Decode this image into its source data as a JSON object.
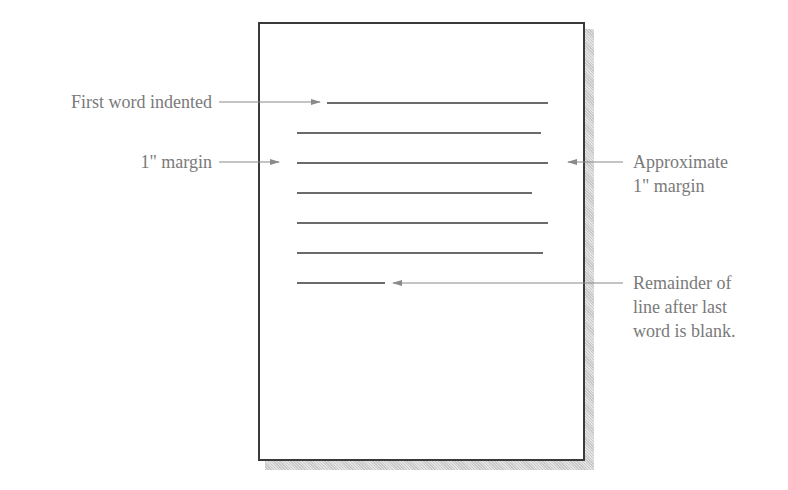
{
  "diagram": {
    "labels": {
      "first_word_indented": "First word indented",
      "left_margin": "1\" margin",
      "right_margin_line1": "Approximate",
      "right_margin_line2": "1\" margin",
      "remainder_line1": "Remainder of",
      "remainder_line2": "line after last",
      "remainder_line3": "word is blank."
    },
    "text_lines": [
      {
        "x1": 327,
        "x2": 548,
        "y": 103
      },
      {
        "x1": 297,
        "x2": 541,
        "y": 133
      },
      {
        "x1": 297,
        "x2": 548,
        "y": 163
      },
      {
        "x1": 297,
        "x2": 532,
        "y": 193
      },
      {
        "x1": 297,
        "x2": 548,
        "y": 223
      },
      {
        "x1": 297,
        "x2": 543,
        "y": 253
      },
      {
        "x1": 297,
        "x2": 385,
        "y": 283
      }
    ],
    "colors": {
      "line": "#3a3a3a",
      "arrow": "#8a8a8a",
      "label": "#7a7a7a"
    }
  }
}
